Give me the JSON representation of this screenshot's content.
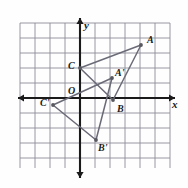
{
  "figure": {
    "type": "coordinate-geometry-diagram",
    "background_color": "#fefefe",
    "grid_color": "#8c8c99",
    "axis_color": "#1a1a1a",
    "shape_color": "#6b6b78",
    "vertex_color": "#58585f"
  },
  "axes": {
    "x_label": "x",
    "y_label": "x_unused",
    "y_axis_label": "y",
    "origin_label": "O",
    "origin_px": {
      "x": 80,
      "y": 98
    },
    "grid_spacing_px": 15,
    "grid_left_px": 20,
    "grid_top_px": 23,
    "grid_right_px": 170,
    "grid_bottom_px": 168,
    "x_axis_y_px": 98,
    "y_axis_x_px": 80,
    "x_axis_start_px": 18,
    "x_axis_end_px": 175,
    "y_axis_start_px": 18,
    "y_axis_end_px": 178,
    "tick_labels_shown": false
  },
  "chart_data": {
    "type": "scatter",
    "title": "",
    "xlabel": "x",
    "ylabel": "y",
    "xlim": [
      -4,
      6
    ],
    "ylim": [
      -5,
      5
    ],
    "grid": true,
    "legend": "none",
    "series": [
      {
        "name": "Triangle ABC",
        "points": [
          {
            "label": "A",
            "x": 4.0,
            "y": 3.5,
            "px": {
              "x": 141,
              "y": 45
            }
          },
          {
            "label": "B",
            "x": 2.2,
            "y": -0.1,
            "px": {
              "x": 113,
              "y": 100
            }
          },
          {
            "label": "C",
            "x": 0.0,
            "y": 2.0,
            "px": {
              "x": 80,
              "y": 68
            }
          }
        ],
        "closed": true
      },
      {
        "name": "Triangle A'B'C'",
        "points": [
          {
            "label": "A'",
            "x": 2.1,
            "y": 1.3,
            "px": {
              "x": 112,
              "y": 78
            }
          },
          {
            "label": "B'",
            "x": 1.1,
            "y": -2.8,
            "px": {
              "x": 96,
              "y": 140
            }
          },
          {
            "label": "C'",
            "x": -1.8,
            "y": -0.5,
            "px": {
              "x": 53,
              "y": 105
            }
          }
        ],
        "closed": true
      }
    ]
  },
  "point_labels": [
    {
      "name": "label-A",
      "text": "A",
      "px": {
        "x": 147,
        "y": 35
      }
    },
    {
      "name": "label-B",
      "text": "B",
      "px": {
        "x": 117,
        "y": 104
      }
    },
    {
      "name": "label-C",
      "text": "C",
      "px": {
        "x": 68,
        "y": 61
      }
    },
    {
      "name": "label-A-prime",
      "text": "A'",
      "px": {
        "x": 115,
        "y": 68
      }
    },
    {
      "name": "label-B-prime",
      "text": "B'",
      "px": {
        "x": 98,
        "y": 143
      }
    },
    {
      "name": "label-C-prime",
      "text": "C'",
      "px": {
        "x": 40,
        "y": 98
      }
    },
    {
      "name": "label-origin",
      "text": "O",
      "px": {
        "x": 68,
        "y": 86
      }
    },
    {
      "name": "label-x-axis",
      "text": "x",
      "px": {
        "x": 172,
        "y": 99
      }
    },
    {
      "name": "label-y-axis",
      "text": "y",
      "px": {
        "x": 84,
        "y": 20
      }
    }
  ]
}
